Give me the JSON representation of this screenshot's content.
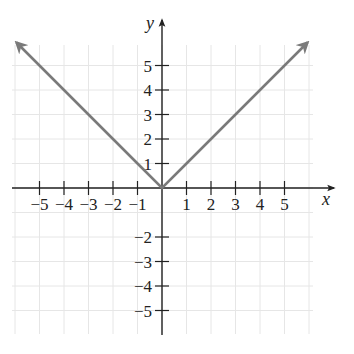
{
  "chart_data": {
    "type": "line",
    "title": "",
    "function": "y = |x|",
    "xlabel": "x",
    "ylabel": "y",
    "xlim": [
      -6,
      6
    ],
    "ylim": [
      -6,
      6
    ],
    "grid": true,
    "x_ticks": [
      -5,
      -4,
      -3,
      -2,
      -1,
      1,
      2,
      3,
      4,
      5
    ],
    "y_ticks": [
      -5,
      -4,
      -3,
      -2,
      1,
      2,
      3,
      4,
      5
    ],
    "x_tick_labels": [
      "−5",
      "−4",
      "−3",
      "−2",
      "−1",
      "1",
      "2",
      "3",
      "4",
      "5"
    ],
    "y_tick_labels_pos": [
      "1",
      "2",
      "3",
      "4",
      "5"
    ],
    "y_tick_labels_neg": [
      "−2",
      "−3",
      "−4",
      "−5"
    ],
    "series": [
      {
        "name": "y = |x|",
        "x": [
          -6,
          -5,
          -4,
          -3,
          -2,
          -1,
          0,
          1,
          2,
          3,
          4,
          5,
          6
        ],
        "y": [
          6,
          5,
          4,
          3,
          2,
          1,
          0,
          1,
          2,
          3,
          4,
          5,
          6
        ],
        "color": "#7a7a7a",
        "arrows_at_ends": true
      }
    ]
  },
  "colors": {
    "axis": "#222222",
    "grid": "#e6e6e6",
    "curve": "#7a7a7a"
  }
}
